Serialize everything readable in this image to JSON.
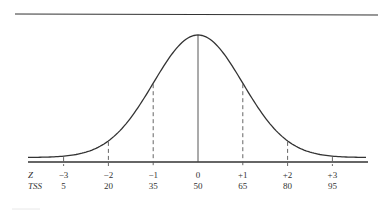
{
  "chart_data": {
    "type": "line",
    "title": "",
    "xlabel": "",
    "ylabel": "",
    "row_labels": [
      "Z",
      "TSS"
    ],
    "x": [
      -3,
      -2,
      -1,
      0,
      1,
      2,
      3
    ],
    "z_labels": [
      "−3",
      "−2",
      "−1",
      "0",
      "+1",
      "+2",
      "+3"
    ],
    "tss_labels": [
      "5",
      "20",
      "35",
      "50",
      "65",
      "80",
      "95"
    ],
    "series": [
      {
        "name": "Z",
        "values": [
          -3,
          -2,
          -1,
          0,
          1,
          2,
          3
        ]
      },
      {
        "name": "TSS",
        "values": [
          5,
          20,
          35,
          50,
          65,
          80,
          95
        ]
      }
    ],
    "curve": "normal",
    "mean": 0,
    "sd": 1,
    "grid": false,
    "legend": "none"
  },
  "colors": {
    "line": "#333333",
    "text": "#333333"
  }
}
